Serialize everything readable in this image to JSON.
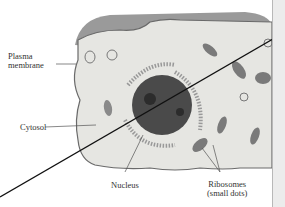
{
  "figure": {
    "labels": {
      "plasma_membrane": [
        "Plasma",
        "membrane"
      ],
      "cytosol": "Cytosol",
      "nucleus": "Nucleus",
      "ribosomes": [
        "Ribosomes",
        "(small dots)"
      ]
    },
    "colors": {
      "cell_fill": "#e6e6e2",
      "membrane": "#6a6a6a",
      "nucleus": "#4a4a4a",
      "organelle": "#7a7a7a",
      "overlay_line": "#111111",
      "panel": "#ececec"
    }
  }
}
